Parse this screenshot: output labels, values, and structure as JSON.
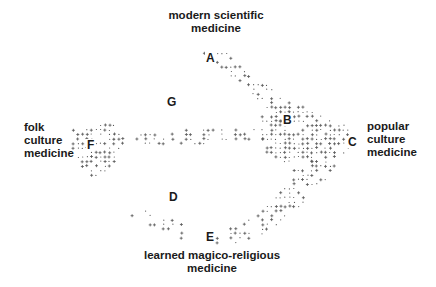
{
  "diagram": {
    "labels": {
      "top": {
        "line1": "modern scientific",
        "line2": "medicine"
      },
      "left": {
        "line1": "folk",
        "line2": "culture",
        "line3": "medicine"
      },
      "right": {
        "line1": "popular",
        "line2": "culture",
        "line3": "medicine"
      },
      "bottom": {
        "line1": "learned magico-religious",
        "line2": "medicine"
      }
    },
    "points": {
      "A": {
        "text": "A",
        "x": 205,
        "y": 52
      },
      "B": {
        "text": "B",
        "x": 283,
        "y": 115
      },
      "C": {
        "text": "C",
        "x": 347,
        "y": 136
      },
      "D": {
        "text": "D",
        "x": 168,
        "y": 191
      },
      "E": {
        "text": "E",
        "x": 206,
        "y": 231
      },
      "F": {
        "text": "F",
        "x": 85,
        "y": 139
      },
      "G": {
        "text": "G",
        "x": 166,
        "y": 96
      }
    },
    "mark_color": "#555555",
    "mark_regions": [
      {
        "name": "A-B band",
        "poly": [
          [
            196,
            50
          ],
          [
            230,
            50
          ],
          [
            240,
            66
          ],
          [
            262,
            80
          ],
          [
            285,
            98
          ],
          [
            300,
            112
          ],
          [
            276,
            125
          ],
          [
            262,
            108
          ],
          [
            244,
            88
          ],
          [
            224,
            70
          ]
        ],
        "density": 0.55
      },
      {
        "name": "B-C cluster",
        "poly": [
          [
            258,
            110
          ],
          [
            300,
            106
          ],
          [
            330,
            120
          ],
          [
            350,
            128
          ],
          [
            352,
            150
          ],
          [
            330,
            160
          ],
          [
            290,
            165
          ],
          [
            262,
            150
          ]
        ],
        "density": 0.75
      },
      {
        "name": "F cluster",
        "poly": [
          [
            70,
            128
          ],
          [
            118,
            124
          ],
          [
            120,
            150
          ],
          [
            110,
            170
          ],
          [
            95,
            178
          ],
          [
            82,
            168
          ],
          [
            72,
            150
          ]
        ],
        "density": 0.7
      },
      {
        "name": "F-B line",
        "poly": [
          [
            110,
            134
          ],
          [
            262,
            126
          ],
          [
            264,
            142
          ],
          [
            112,
            146
          ]
        ],
        "density": 0.35
      },
      {
        "name": "C-E diagonal",
        "poly": [
          [
            300,
            160
          ],
          [
            340,
            158
          ],
          [
            320,
            190
          ],
          [
            290,
            215
          ],
          [
            260,
            236
          ],
          [
            232,
            244
          ],
          [
            226,
            232
          ],
          [
            256,
            214
          ],
          [
            282,
            190
          ]
        ],
        "density": 0.55
      },
      {
        "name": "D-E arc",
        "poly": [
          [
            122,
            206
          ],
          [
            150,
            210
          ],
          [
            182,
            222
          ],
          [
            206,
            236
          ],
          [
            240,
            240
          ],
          [
            236,
            248
          ],
          [
            200,
            246
          ],
          [
            170,
            234
          ],
          [
            140,
            222
          ],
          [
            124,
            214
          ]
        ],
        "density": 0.3
      }
    ]
  }
}
